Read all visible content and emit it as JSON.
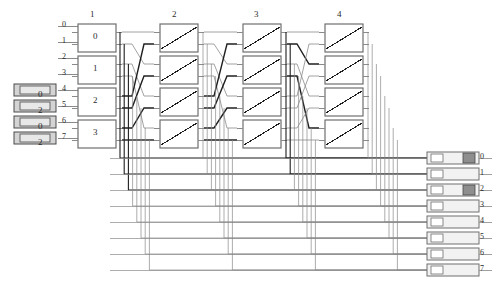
{
  "diagram": {
    "type": "multistage-interconnection-network",
    "stage_headers": [
      "1",
      "2",
      "3",
      "4"
    ],
    "input_port_labels": [
      "0",
      "1",
      "2",
      "3",
      "4",
      "5",
      "6",
      "7"
    ],
    "output_port_labels": [
      "0",
      "1",
      "2",
      "3",
      "4",
      "5",
      "6",
      "7"
    ],
    "stage1_switch_labels": [
      "0",
      "1",
      "2",
      "3"
    ],
    "stage2_switch_labels": [
      "",
      "",
      "",
      ""
    ],
    "stage3_switch_labels": [
      "",
      "",
      "",
      ""
    ],
    "stage4_switch_labels": [
      "",
      "",
      "",
      ""
    ],
    "input_packets": [
      {
        "label": "0",
        "row": 4
      },
      {
        "label": "2",
        "row": 5
      },
      {
        "label": "0",
        "row": 6
      },
      {
        "label": "2",
        "row": 7
      }
    ],
    "output_buffers": [
      {
        "row": "0",
        "filled": true
      },
      {
        "row": "1",
        "filled": false
      },
      {
        "row": "2",
        "filled": true
      },
      {
        "row": "3",
        "filled": false
      },
      {
        "row": "4",
        "filled": false
      },
      {
        "row": "5",
        "filled": false
      },
      {
        "row": "6",
        "filled": false
      },
      {
        "row": "7",
        "filled": false
      }
    ],
    "colors": {
      "line": "#8a8a8a",
      "line_active": "#1f1f1f",
      "box_stroke": "#6f6f6f",
      "packet_fill": "#d4d4d4",
      "packet_stroke": "#4a4a4a",
      "buffer_fill": "#f2f2f2",
      "buffer_marker": "#8e8e8e",
      "text": "#2b2b2b",
      "background": "#ffffff"
    }
  }
}
